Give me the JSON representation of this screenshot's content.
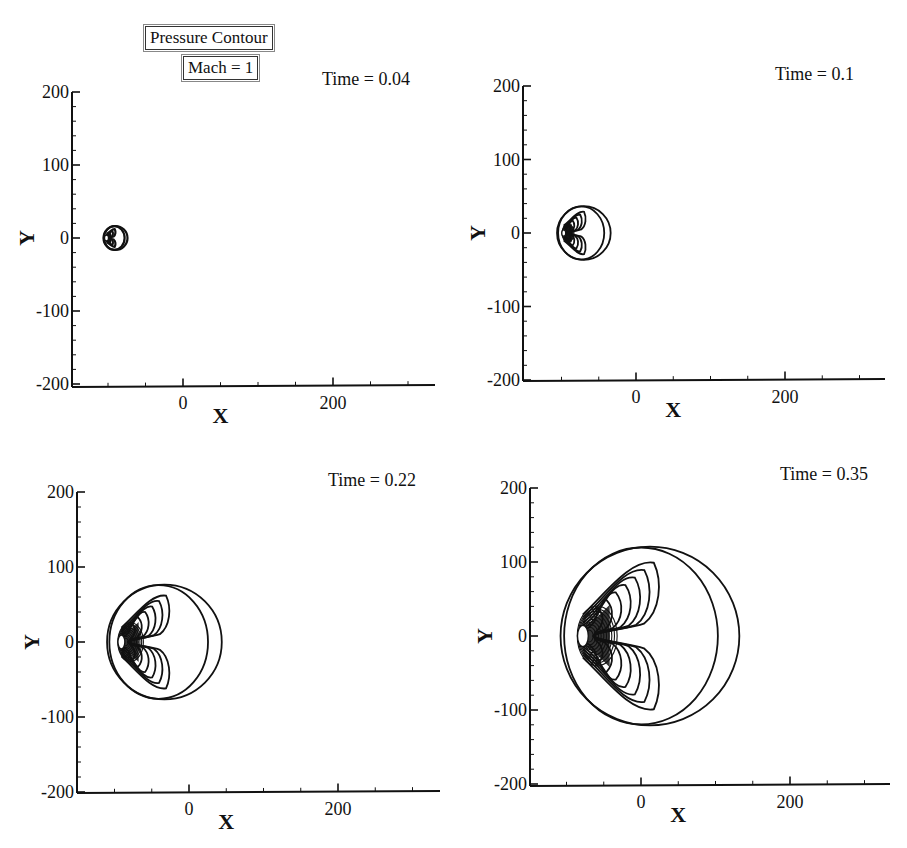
{
  "figure": {
    "title": "Pressure Contour",
    "subtitle": "Mach = 1",
    "ink_color": "#111111",
    "background": "#ffffff"
  },
  "chart_data": [
    {
      "type": "contour",
      "title": "Pressure Contour",
      "subtitle": "Mach = 1",
      "annotation": "Time = 0.04",
      "time": 0.04,
      "xlabel": "X",
      "ylabel": "Y",
      "xlim": [
        -148,
        336
      ],
      "ylim": [
        -200,
        200
      ],
      "xticks": [
        0,
        200
      ],
      "yticks": [
        -200,
        -100,
        0,
        100,
        200
      ],
      "xtick_labels": [
        "0",
        "200"
      ],
      "ytick_labels": [
        "-200",
        "-100",
        "0",
        "100",
        "200"
      ],
      "grid": false,
      "wave_front": {
        "center_x": -90,
        "center_y": 0,
        "radius": 16
      },
      "inner_contour_levels": 3
    },
    {
      "type": "contour",
      "annotation": "Time = 0.1",
      "time": 0.1,
      "xlabel": "X",
      "ylabel": "Y",
      "xlim": [
        -150,
        336
      ],
      "ylim": [
        -200,
        200
      ],
      "xticks": [
        0,
        200
      ],
      "yticks": [
        -200,
        -100,
        0,
        100,
        200
      ],
      "xtick_labels": [
        "0",
        "200"
      ],
      "ytick_labels": [
        "-200",
        "-100",
        "0",
        "100",
        "200"
      ],
      "grid": false,
      "wave_front": {
        "center_x": -70,
        "center_y": 0,
        "radius": 36
      },
      "inner_contour_levels": 5
    },
    {
      "type": "contour",
      "annotation": "Time = 0.22",
      "time": 0.22,
      "xlabel": "X",
      "ylabel": "Y",
      "xlim": [
        -150,
        336
      ],
      "ylim": [
        -200,
        200
      ],
      "xticks": [
        0,
        200
      ],
      "yticks": [
        -200,
        -100,
        0,
        100,
        200
      ],
      "xtick_labels": [
        "0",
        "200"
      ],
      "ytick_labels": [
        "-200",
        "-100",
        "0",
        "100",
        "200"
      ],
      "grid": false,
      "wave_front": {
        "center_x": -33,
        "center_y": 0,
        "radius": 77
      },
      "inner_contour_levels": 6
    },
    {
      "type": "contour",
      "annotation": "Time = 0.35",
      "time": 0.35,
      "xlabel": "X",
      "ylabel": "Y",
      "xlim": [
        -149,
        335
      ],
      "ylim": [
        -200,
        200
      ],
      "xticks": [
        0,
        200
      ],
      "yticks": [
        -200,
        -100,
        0,
        100,
        200
      ],
      "xtick_labels": [
        "0",
        "200"
      ],
      "ytick_labels": [
        "-200",
        "-100",
        "0",
        "100",
        "200"
      ],
      "grid": false,
      "wave_front": {
        "center_x": 12,
        "center_y": 0,
        "radius": 120
      },
      "inner_contour_levels": 7
    }
  ],
  "panels": [
    {
      "annotation": "Time = 0.04",
      "x_label": "X",
      "y_label": "Y",
      "px": {
        "axis_left": 72,
        "x0": 183,
        "x200": 333,
        "axis_right": 435,
        "y200": 92,
        "y0": 238,
        "ym200": 387
      },
      "note_pos": [
        322,
        85
      ]
    },
    {
      "annotation": "Time = 0.1",
      "x_label": "X",
      "y_label": "Y",
      "px": {
        "axis_left": 523,
        "x0": 636,
        "x200": 785,
        "axis_right": 885,
        "y200": 86,
        "y0": 233,
        "ym200": 381
      },
      "note_pos": [
        775,
        80
      ]
    },
    {
      "annotation": "Time = 0.22",
      "x_label": "X",
      "y_label": "Y",
      "px": {
        "axis_left": 77,
        "x0": 189,
        "x200": 338,
        "axis_right": 440,
        "y200": 492,
        "y0": 642,
        "ym200": 793
      },
      "note_pos": [
        328,
        486
      ]
    },
    {
      "annotation": "Time = 0.35",
      "x_label": "X",
      "y_label": "Y",
      "px": {
        "axis_left": 530,
        "x0": 641,
        "x200": 790,
        "axis_right": 890,
        "y200": 488,
        "y0": 636,
        "ym200": 786
      },
      "note_pos": [
        780,
        480
      ]
    }
  ]
}
